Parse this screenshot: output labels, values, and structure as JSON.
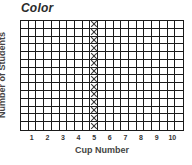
{
  "chart_data": {
    "type": "table",
    "title": "Color",
    "xlabel": "Cup Number",
    "ylabel": "Number of Students",
    "categories": [
      "1",
      "2",
      "3",
      "4",
      "5",
      "6",
      "7",
      "8",
      "9",
      "10"
    ],
    "grid": {
      "columns": 21,
      "rows": 14,
      "label_columns": [
        1,
        3,
        5,
        7,
        9,
        11,
        13,
        15,
        17,
        19
      ]
    },
    "marked_column": {
      "category": "5",
      "column_index": 9,
      "marked_rows": 14,
      "mark": "X"
    },
    "values": [
      0,
      0,
      0,
      0,
      14,
      0,
      0,
      0,
      0,
      0
    ],
    "grid_on": true,
    "legend": null
  },
  "colors": {
    "line": "#1a1a1a",
    "title": "#2a2a2a",
    "label": "#444444",
    "background": "#ffffff"
  }
}
